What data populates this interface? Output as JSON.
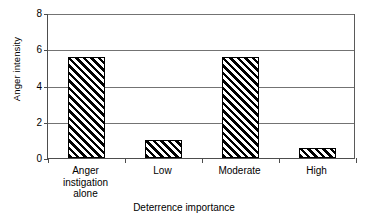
{
  "chart_data": {
    "type": "bar",
    "title": "",
    "xlabel": "Deterrence importance",
    "ylabel": "Anger intensity",
    "categories": [
      "Anger\ninstigation\nalone",
      "Low",
      "Moderate",
      "High"
    ],
    "values": [
      5.55,
      1.0,
      5.6,
      0.55
    ],
    "ylim": [
      0,
      8
    ],
    "yticks": [
      0,
      2,
      4,
      6,
      8
    ],
    "ytick_labels": [
      "0",
      "2",
      "4",
      "6",
      "8"
    ],
    "grid": true,
    "legend": false,
    "series": [
      {
        "name": "Anger intensity",
        "values": [
          5.55,
          1.0,
          5.6,
          0.55
        ],
        "fill": "diagonal-hatch",
        "edge_color": "#000000",
        "hatch_color": "#000000"
      }
    ],
    "colors": {
      "axis": "#4d4d4d",
      "gridline": "#737373",
      "bar_edge": "#000000",
      "bar_hatch": "#000000",
      "background": "#ffffff",
      "text": "#000000"
    }
  }
}
